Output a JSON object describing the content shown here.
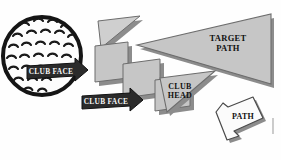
{
  "diagram": {
    "background_color": "#fefefe",
    "labels": {
      "target_path_line1": "TARGET",
      "target_path_line2": "PATH",
      "club_head_line1": "CLUB",
      "club_head_line2": "HEAD",
      "club_face_upper": "CLUB FACE",
      "club_face_lower": "CLUB FACE",
      "path": "PATH"
    },
    "colors": {
      "triangle_fill": "#c6c6c6",
      "triangle_fill_light": "#cfcfcf",
      "triangle_edge": "#6d6d6d",
      "triangle_shadow": "#8c8c8c",
      "banner_dark": "#2b2b2b",
      "banner_dark_edge": "#111111",
      "ball_outline": "#151515",
      "ball_fill": "#fdfdfd",
      "dimple_stroke": "#1a1a1a",
      "path_shape_fill": "#fbfbfb",
      "path_shape_edge": "#4a4a4a",
      "text_dark": "#111111",
      "text_light": "#f4f4f4"
    },
    "shapes": [
      {
        "name": "golf-ball",
        "type": "circle",
        "cx": 42,
        "cy": 56,
        "r": 40,
        "dimple_rows": 7
      },
      {
        "name": "target-path-triangle",
        "type": "triangle",
        "label": "TARGET PATH",
        "size": "large"
      },
      {
        "name": "club-head-triangle",
        "type": "triangle",
        "label": "CLUB HEAD",
        "size": "medium"
      },
      {
        "name": "club-face-banner-upper",
        "type": "arrow-banner",
        "label": "CLUB FACE",
        "direction": "right"
      },
      {
        "name": "club-face-banner-lower",
        "type": "arrow-banner",
        "label": "CLUB FACE",
        "direction": "right"
      },
      {
        "name": "path-callout",
        "type": "bent-arrow",
        "label": "PATH",
        "direction": "up-left"
      }
    ]
  }
}
